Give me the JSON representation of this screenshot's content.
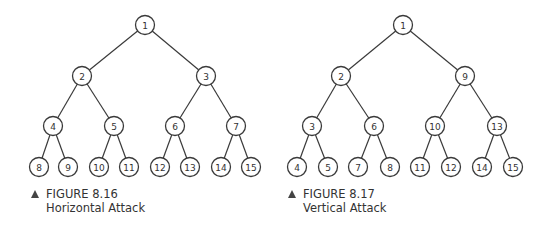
{
  "figures": [
    {
      "id": "fig-8-16",
      "caption_number": "FIGURE 8.16",
      "caption_title": "Horizontal Attack",
      "nodes": [
        {
          "label": "1",
          "x": 145,
          "y": 25
        },
        {
          "label": "2",
          "x": 82,
          "y": 76
        },
        {
          "label": "3",
          "x": 206,
          "y": 76
        },
        {
          "label": "4",
          "x": 53,
          "y": 126
        },
        {
          "label": "5",
          "x": 114,
          "y": 126
        },
        {
          "label": "6",
          "x": 175,
          "y": 126
        },
        {
          "label": "7",
          "x": 236,
          "y": 126
        },
        {
          "label": "8",
          "x": 39,
          "y": 167
        },
        {
          "label": "9",
          "x": 68,
          "y": 167
        },
        {
          "label": "10",
          "x": 99,
          "y": 167
        },
        {
          "label": "11",
          "x": 129,
          "y": 167
        },
        {
          "label": "12",
          "x": 160,
          "y": 167
        },
        {
          "label": "13",
          "x": 190,
          "y": 167
        },
        {
          "label": "14",
          "x": 221,
          "y": 167
        },
        {
          "label": "15",
          "x": 251,
          "y": 167
        }
      ],
      "edges": [
        [
          0,
          1
        ],
        [
          0,
          2
        ],
        [
          1,
          3
        ],
        [
          1,
          4
        ],
        [
          2,
          5
        ],
        [
          2,
          6
        ],
        [
          3,
          7
        ],
        [
          3,
          8
        ],
        [
          4,
          9
        ],
        [
          4,
          10
        ],
        [
          5,
          11
        ],
        [
          5,
          12
        ],
        [
          6,
          13
        ],
        [
          6,
          14
        ]
      ]
    },
    {
      "id": "fig-8-17",
      "caption_number": "FIGURE 8.17",
      "caption_title": "Vertical Attack",
      "nodes": [
        {
          "label": "1",
          "x": 403,
          "y": 25
        },
        {
          "label": "2",
          "x": 341,
          "y": 76
        },
        {
          "label": "9",
          "x": 465,
          "y": 76
        },
        {
          "label": "3",
          "x": 312,
          "y": 126
        },
        {
          "label": "6",
          "x": 374,
          "y": 126
        },
        {
          "label": "10",
          "x": 435,
          "y": 126
        },
        {
          "label": "13",
          "x": 497,
          "y": 126
        },
        {
          "label": "4",
          "x": 297,
          "y": 167
        },
        {
          "label": "5",
          "x": 328,
          "y": 167
        },
        {
          "label": "7",
          "x": 358,
          "y": 167
        },
        {
          "label": "8",
          "x": 390,
          "y": 167
        },
        {
          "label": "11",
          "x": 420,
          "y": 167
        },
        {
          "label": "12",
          "x": 451,
          "y": 167
        },
        {
          "label": "14",
          "x": 482,
          "y": 167
        },
        {
          "label": "15",
          "x": 513,
          "y": 167
        }
      ],
      "edges": [
        [
          0,
          1
        ],
        [
          0,
          2
        ],
        [
          1,
          3
        ],
        [
          1,
          4
        ],
        [
          2,
          5
        ],
        [
          2,
          6
        ],
        [
          3,
          7
        ],
        [
          3,
          8
        ],
        [
          4,
          9
        ],
        [
          4,
          10
        ],
        [
          5,
          11
        ],
        [
          5,
          12
        ],
        [
          6,
          13
        ],
        [
          6,
          14
        ]
      ]
    }
  ],
  "style": {
    "node_radius": 9.5,
    "line_color": "#3a3a3a"
  }
}
